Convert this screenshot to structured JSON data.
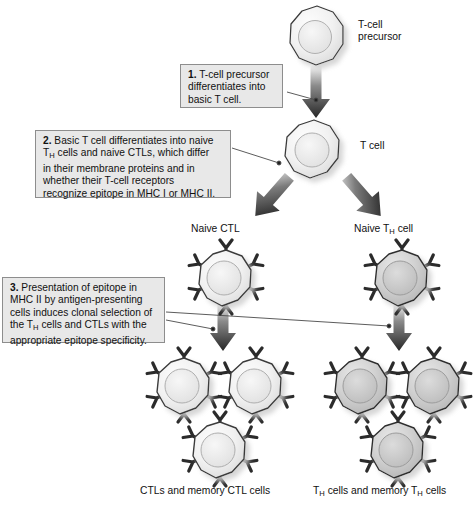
{
  "figure": {
    "background": "#ffffff"
  },
  "palette": {
    "callout_fill": "#e8e8e8",
    "callout_border": "#8d8d8d",
    "text": "#111111",
    "arrow_dark": "#2b2b2b",
    "leader_line": "#4a4a4a",
    "cell_light_fill": "#f2f2f2",
    "cell_light_stroke": "#3a3a3a",
    "cell_dark_fill": "#c9c9c9",
    "cell_dark_stroke": "#2e2e2e",
    "nucleus_light": "#e4e4e4",
    "nucleus_dark": "#bdbdbd",
    "receptor": "#2b2b2b",
    "shadow": "#b9b9b9"
  },
  "callouts": [
    {
      "id": "step-1",
      "number": "1.",
      "text": "T-cell precursor differentiates into basic T cell.",
      "lines": [
        "T-cell precursor",
        "differentiates into",
        "basic T cell."
      ]
    },
    {
      "id": "step-2",
      "number": "2.",
      "text": "Basic T cell differentiates into naive TH cells and naive CTLs, which differ in their membrane proteins and in whether their T-cell receptors recognize epitope in MHC I or MHC II.",
      "lines": [
        "Basic T cell differentiates into naive",
        "cells and naive CTLs, which differ",
        "in their membrane proteins and in",
        "whether their T-cell receptors",
        "recognize epitope in MHC I or MHC II."
      ],
      "subscript_token": "H",
      "subscript_base": "T"
    },
    {
      "id": "step-3",
      "number": "3.",
      "text": "Presentation of epitope in MHC II by antigen-presenting cells induces clonal selection of the TH cells and CTLs with the appropriate epitope specificity.",
      "lines": [
        "Presentation of epitope in",
        "MHC II by antigen-presenting",
        "cells induces clonal selection of",
        "cells and CTLs with the",
        "appropriate epitope specificity."
      ],
      "subscript_token": "H",
      "subscript_base": "T"
    }
  ],
  "labels": {
    "precursor_line1": "T-cell",
    "precursor_line2": "precursor",
    "t_cell": "T cell",
    "naive_ctl": "Naive CTL",
    "naive_th_pre": "Naive T",
    "naive_th_sub": "H",
    "naive_th_post": " cell",
    "ctl_result": "CTLs and memory CTL cells",
    "th_result_a": "T",
    "th_result_sub1": "H",
    "th_result_b": " cells and memory T",
    "th_result_sub2": "H",
    "th_result_c": " cells"
  },
  "cells": [
    {
      "id": "t-cell-precursor",
      "name": "t-cell-precursor",
      "x": 287,
      "y": 5,
      "size": 56,
      "tone": "light",
      "receptors": 0
    },
    {
      "id": "basic-t-cell",
      "name": "basic-t-cell",
      "x": 283,
      "y": 119,
      "size": 56,
      "tone": "light",
      "receptors": 0
    },
    {
      "id": "naive-ctl",
      "name": "naive-ctl",
      "x": 194,
      "y": 245,
      "size": 58,
      "tone": "light",
      "receptors": 6
    },
    {
      "id": "naive-th",
      "name": "naive-th-cell",
      "x": 370,
      "y": 245,
      "size": 58,
      "tone": "dark",
      "receptors": 6
    },
    {
      "id": "ctl-a",
      "name": "ctl-clone",
      "x": 152,
      "y": 353,
      "size": 58,
      "tone": "light",
      "receptors": 6
    },
    {
      "id": "ctl-b",
      "name": "ctl-clone",
      "x": 224,
      "y": 353,
      "size": 58,
      "tone": "light",
      "receptors": 6
    },
    {
      "id": "ctl-c",
      "name": "ctl-clone",
      "x": 188,
      "y": 417,
      "size": 58,
      "tone": "light",
      "receptors": 6
    },
    {
      "id": "th-a",
      "name": "th-clone",
      "x": 330,
      "y": 353,
      "size": 58,
      "tone": "dark",
      "receptors": 6
    },
    {
      "id": "th-b",
      "name": "th-clone",
      "x": 402,
      "y": 353,
      "size": 58,
      "tone": "dark",
      "receptors": 6
    },
    {
      "id": "th-c",
      "name": "th-clone",
      "x": 366,
      "y": 417,
      "size": 58,
      "tone": "dark",
      "receptors": 6
    }
  ],
  "arrows": [
    {
      "id": "arrow-precursor-to-tcell",
      "kind": "vertical",
      "x1": 315,
      "y1": 70,
      "x2": 315,
      "y2": 116
    },
    {
      "id": "arrow-tcell-to-ctl",
      "kind": "diagonal",
      "x1": 292,
      "y1": 175,
      "x2": 248,
      "y2": 214
    },
    {
      "id": "arrow-tcell-to-th",
      "kind": "diagonal",
      "x1": 336,
      "y1": 175,
      "x2": 380,
      "y2": 214
    },
    {
      "id": "arrow-ctl-clonal",
      "kind": "vertical",
      "x1": 222,
      "y1": 307,
      "x2": 222,
      "y2": 350
    },
    {
      "id": "arrow-th-clonal",
      "kind": "vertical",
      "x1": 398,
      "y1": 307,
      "x2": 398,
      "y2": 350
    }
  ],
  "leaders": [
    {
      "id": "leader-step1",
      "x1": 287,
      "y1": 92,
      "x2": 318,
      "y2": 100,
      "dot_at": "end"
    },
    {
      "id": "leader-step2",
      "x1": 232,
      "y1": 148,
      "x2": 280,
      "y2": 163,
      "dot_at": "end"
    },
    {
      "id": "leader-step3-ctl",
      "x1": 166,
      "y1": 318,
      "x2": 214,
      "y2": 327,
      "dot_at": "end"
    },
    {
      "id": "leader-step3-th",
      "x1": 166,
      "y1": 311,
      "x2": 390,
      "y2": 325,
      "dot_at": "end"
    }
  ]
}
